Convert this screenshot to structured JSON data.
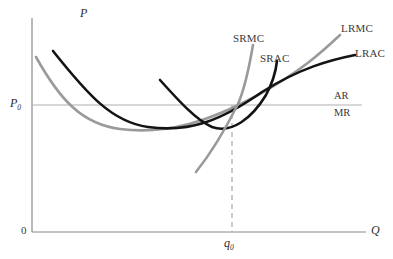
{
  "figure": {
    "title": "",
    "background_color": "#ffffff"
  },
  "axes": {
    "y_label": "P",
    "x_label": "Q",
    "origin_label": "0",
    "axis_color": "#8a8a8a",
    "x_axis_y_px": 232,
    "y_axis_x_px": 32
  },
  "annotations": {
    "price_label_text": "P",
    "price_label_sub": "0",
    "quantity_label_text": "q",
    "quantity_label_sub": "0",
    "revenue_upper": "AR",
    "revenue_lower": "MR"
  },
  "curve_labels": {
    "srmc": "SRMC",
    "srac": "SRAC",
    "lrmc": "LRMC",
    "lrac": "LRAC"
  },
  "colors": {
    "black_curve": "#141414",
    "gray_curve": "#9a9a9a",
    "axis": "#8a8a8a",
    "guide_line": "#b0b0b0",
    "dashed_line": "#a8a8a8",
    "text": "#2b2b2b"
  },
  "chart_data": {
    "type": "line",
    "xlabel": "Q",
    "ylabel": "P",
    "grid": false,
    "legend": "inline-curve-labels",
    "xlim": [
      0,
      393
    ],
    "ylim": [
      0,
      259
    ],
    "equilibrium": {
      "label": "tangency / equilibrium point",
      "x_px": 232,
      "y_px": 105,
      "price_tick": "P0",
      "quantity_tick": "q0"
    },
    "horizontal_price_line": {
      "name": "AR = MR = P0 (demand line)",
      "y_px": 105,
      "x_start_px": 32,
      "x_end_px": 362,
      "color": "#b0b0b0"
    },
    "dashed_drop_line": {
      "name": "q0 drop line",
      "x_px": 232,
      "y_start_px": 105,
      "y_end_px": 232,
      "color": "#a8a8a8"
    },
    "series": [
      {
        "name": "LRAC",
        "color": "#141414",
        "style": "solid",
        "width_px": 2.6,
        "path": "M 53 51 C 88 95, 112 122, 148 127 C 190 133, 222 120, 262 92 C 300 68, 330 60, 355 55"
      },
      {
        "name": "LRMC",
        "color": "#9a9a9a",
        "style": "solid",
        "width_px": 2.6,
        "path": "M 36 57 C 60 100, 82 124, 120 129 C 168 135, 210 121, 258 95 C 300 72, 322 52, 340 35"
      },
      {
        "name": "SRAC",
        "color": "#141414",
        "style": "solid",
        "width_px": 2.6,
        "path": "M 160 80 C 178 100, 196 120, 212 127 C 232 134, 252 118, 266 95 C 272 84, 276 70, 277 61"
      },
      {
        "name": "SRMC",
        "color": "#9a9a9a",
        "style": "solid",
        "width_px": 2.6,
        "path": "M 196 172 C 212 152, 226 128, 238 104 C 246 86, 250 62, 253 45"
      }
    ]
  }
}
